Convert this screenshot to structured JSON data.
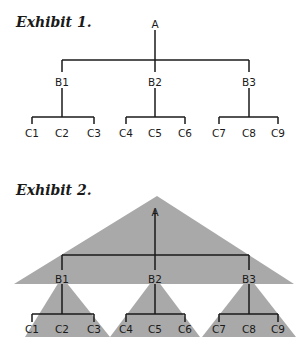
{
  "exhibit1": {
    "title": "Exhibit 1.",
    "root": "A",
    "level_b": [
      "B1",
      "B2",
      "B3"
    ],
    "level_c": [
      "C1",
      "C2",
      "C3",
      "C4",
      "C5",
      "C6",
      "C7",
      "C8",
      "C9"
    ]
  },
  "exhibit2": {
    "title": "Exhibit 2.",
    "root": "A",
    "level_b": [
      "B1",
      "B2",
      "B3"
    ],
    "level_c": [
      "C1",
      "C2",
      "C3",
      "C4",
      "C5",
      "C6",
      "C7",
      "C8",
      "C9"
    ],
    "fill_color": "#a8a8a8"
  }
}
